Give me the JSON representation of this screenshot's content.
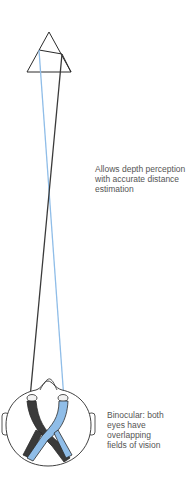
{
  "diagram": {
    "colors": {
      "left_eye_path": "#3a3a3a",
      "right_eye_path": "#8fbde8",
      "outline": "#2b2b2b",
      "text": "#555555"
    },
    "object": {
      "shape": "overlapping triangles (arrow tip)"
    },
    "annotations": {
      "depth": {
        "lines": [
          "Allows depth perception",
          "with accurate distance",
          "estimation"
        ]
      },
      "binocular": {
        "lines": [
          "Binocular: both",
          "eyes have",
          "overlapping",
          "fields of vision"
        ]
      }
    },
    "head": {
      "view": "top-down",
      "eyes": 2
    }
  }
}
